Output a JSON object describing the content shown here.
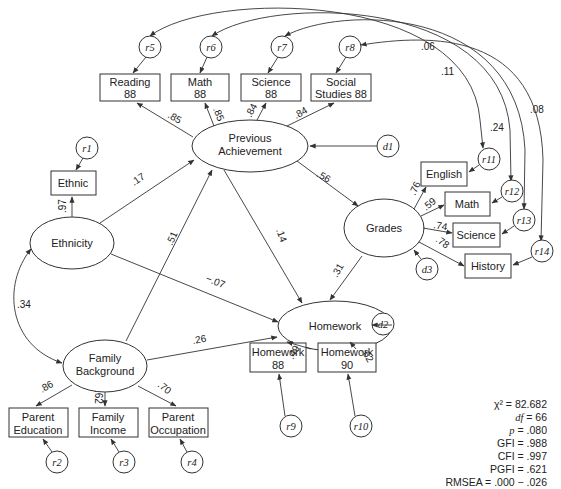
{
  "diagram": {
    "type": "structural-equation-path-diagram",
    "latent": {
      "previous_achievement": [
        "Previous",
        "Achievement"
      ],
      "ethnicity": "Ethnicity",
      "grades": "Grades",
      "homework": "Homework",
      "family_background": [
        "Family",
        "Background"
      ]
    },
    "observed": {
      "reading88": [
        "Reading",
        "88"
      ],
      "math88": [
        "Math",
        "88"
      ],
      "science88": [
        "Science",
        "88"
      ],
      "social88": [
        "Social",
        "Studies 88"
      ],
      "ethnic": "Ethnic",
      "english": "English",
      "math": "Math",
      "science": "Science",
      "history": "History",
      "homework88": [
        "Homework",
        "88"
      ],
      "homework90": [
        "Homework",
        "90"
      ],
      "parent_education": [
        "Parent",
        "Education"
      ],
      "family_income": [
        "Family",
        "Income"
      ],
      "parent_occupation": [
        "Parent",
        "Occupation"
      ]
    },
    "residuals": {
      "r1": "r1",
      "r2": "r2",
      "r3": "r3",
      "r4": "r4",
      "r5": "r5",
      "r6": "r6",
      "r7": "r7",
      "r8": "r8",
      "r9": "r9",
      "r10": "r10",
      "r11": "r11",
      "r12": "r12",
      "r13": "r13",
      "r14": "r14"
    },
    "disturbances": {
      "d1": "d1",
      "d2": "d2",
      "d3": "d3"
    },
    "coefficients": {
      "pa_reading": ".85",
      "pa_math": ".85",
      "pa_science": ".84",
      "pa_social": ".84",
      "eth_ethnic": ".97",
      "eth_pa": ".17",
      "fb_pa": ".51",
      "eth_fb_corr": ".34",
      "eth_hw": "−.07",
      "pa_grades": ".56",
      "pa_hw": ".14",
      "grades_hw": ".31",
      "fb_hw": ".26",
      "grades_english": ".76",
      "grades_math": ".59",
      "grades_science": ".74",
      "grades_history": ".78",
      "hw_hw88": ".49",
      "hw_hw90": ".62",
      "fb_pe": ".86",
      "fb_fi": ".62",
      "fb_po": ".70",
      "corr_r5_r11": ".11",
      "corr_r6_r12": ".24",
      "corr_r8_r12": ".06",
      "corr_r7_r14": ".08"
    }
  },
  "fit_stats": {
    "chi2": "χ² = 82.682",
    "df_label": "df",
    "df_value": " = 66",
    "p_label": "p",
    "p_value": " = .080",
    "gfi": "GFI = .988",
    "cfi": "CFI = .997",
    "pgfi": "PGFI = .621",
    "rmsea": "RMSEA = .000 − .026"
  }
}
